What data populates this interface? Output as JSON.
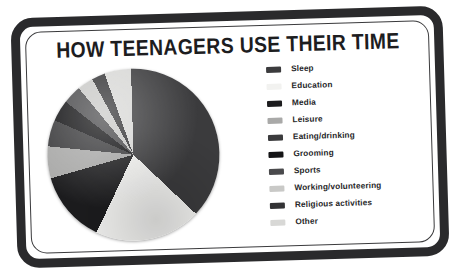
{
  "poster": {
    "title": "HOW TEENAGERS USE THEIR TIME",
    "background_color": "#ffffff",
    "frame_color": "#2a2a2c",
    "text_color": "#262628"
  },
  "chart_data": {
    "type": "pie",
    "title": "HOW TEENAGERS USE THEIR TIME",
    "xlabel": "",
    "ylabel": "",
    "legend_position": "right",
    "grid": false,
    "start_angle_deg": 0,
    "direction": "clockwise",
    "categories": [
      "Sleep",
      "Education",
      "Media",
      "Leisure",
      "Eating/drinking",
      "Grooming",
      "Sports",
      "Working/volunteering",
      "Religious activities",
      "Other"
    ],
    "values": [
      37.5,
      20.0,
      13.5,
      6.0,
      5.0,
      4.0,
      3.5,
      3.0,
      2.5,
      5.0
    ],
    "colors": [
      "#3b3b3d",
      "#f2f2f0",
      "#1c1c1e",
      "#a9a9a8",
      "#3b3b3d",
      "#141416",
      "#4a4a4c",
      "#c9c9c7",
      "#333335",
      "#d8d8d6"
    ]
  },
  "legend": {
    "items": [
      {
        "label": "Sleep",
        "color": "#3b3b3d"
      },
      {
        "label": "Education",
        "color": "#f2f2f0"
      },
      {
        "label": "Media",
        "color": "#1c1c1e"
      },
      {
        "label": "Leisure",
        "color": "#a9a9a8"
      },
      {
        "label": "Eating/drinking",
        "color": "#3b3b3d"
      },
      {
        "label": "Grooming",
        "color": "#141416"
      },
      {
        "label": "Sports",
        "color": "#4a4a4c"
      },
      {
        "label": "Working/volunteering",
        "color": "#c9c9c7"
      },
      {
        "label": "Religious activities",
        "color": "#333335"
      },
      {
        "label": "Other",
        "color": "#d8d8d6"
      }
    ]
  }
}
